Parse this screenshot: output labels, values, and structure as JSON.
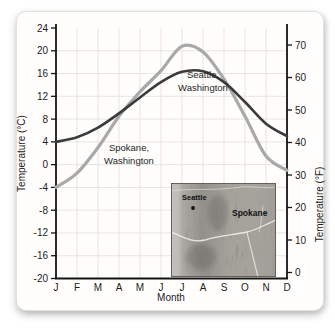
{
  "figure": {
    "description_labels": {
      "month_axis_label": "Month"
    }
  },
  "chart_data": {
    "type": "line",
    "title": "",
    "categories": [
      "J",
      "F",
      "M",
      "A",
      "M",
      "J",
      "J",
      "A",
      "S",
      "O",
      "N",
      "D"
    ],
    "xlabel": "Month",
    "ylabel_left": "Temperature (°C)",
    "ylabel_right": "Temperature (°F)",
    "ylim_c": [
      -20,
      24
    ],
    "ylim_f": [
      0,
      75
    ],
    "yticks_c": [
      24,
      20,
      16,
      12,
      8,
      4,
      0,
      -4,
      -8,
      -12,
      -16,
      -20
    ],
    "yticks_f": [
      70,
      60,
      50,
      40,
      30,
      20,
      10,
      0
    ],
    "grid": true,
    "legend_position": "inline-annotations",
    "colors": {
      "seattle_line": "#3b3b3b",
      "spokane_line": "#a9a9a9",
      "gridline": "#e6e4e0",
      "axis": "#141414"
    },
    "series": [
      {
        "name": "Seattle, Washington",
        "units": "°C",
        "values": [
          4,
          4.8,
          6.5,
          9,
          11.8,
          14.5,
          16.3,
          16.4,
          14.5,
          11,
          7.2,
          5
        ],
        "annotation": {
          "line1": "Seattle,",
          "line2": "Washington"
        }
      },
      {
        "name": "Spokane, Washington",
        "units": "°C",
        "values": [
          -4,
          -1.5,
          3,
          8.5,
          12.8,
          16.5,
          20.8,
          19.8,
          15,
          8.5,
          1.5,
          -1
        ],
        "annotation": {
          "line1": "Spokane,",
          "line2": "Washington"
        }
      }
    ]
  },
  "inset_map": {
    "seattle_label": "Seattle",
    "spokane_label": "Spokane"
  }
}
